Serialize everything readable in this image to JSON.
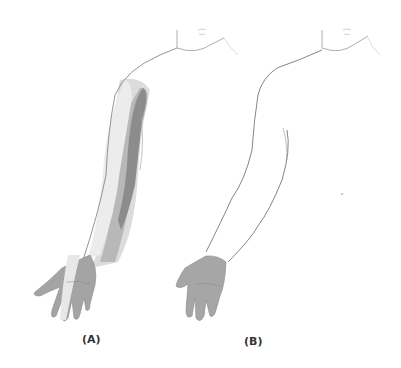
{
  "figure": {
    "panels": [
      {
        "id": "A",
        "label": "(A)",
        "description": "Arm with shaded dermatome bands along forearm and upper arm"
      },
      {
        "id": "B",
        "label": "(B)",
        "description": "Arm outline with shaded palm/hand region only"
      }
    ],
    "colors": {
      "outline": "#7a7a7a",
      "dark_band": "#8a8a8a",
      "mid_band": "#b4b4b4",
      "light_band": "#d8d8d8",
      "hand_shade": "#a8a8a8",
      "label": "#333333"
    }
  }
}
